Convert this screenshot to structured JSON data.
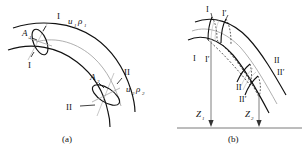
{
  "figure": {
    "type": "technical-line-diagram",
    "background_color": "#ffffff",
    "line_color": "#111111",
    "secondary_line_color": "#999999",
    "panels": [
      {
        "id": "a",
        "caption": "(a)",
        "labels": {
          "section_1_top": "I",
          "section_1_bottom": "I",
          "section_2_top": "II",
          "section_2_bottom": "II",
          "area_1": "A",
          "area_1_sub": "1",
          "area_2": "A",
          "area_2_sub": "2",
          "velocity_1": "u",
          "velocity_1_sub": "1",
          "density_1": "ρ",
          "density_1_sub": "1",
          "velocity_2": "u",
          "velocity_2_sub": "2",
          "density_2": "ρ",
          "density_2_sub": "2"
        }
      },
      {
        "id": "b",
        "caption": "(b)",
        "labels": {
          "section_1_top": "I",
          "section_1p_top": "I′",
          "section_1_bottom": "I",
          "section_1p_bottom": "I′",
          "section_2_top": "II",
          "section_2p_top": "II′",
          "section_2_bottom": "II",
          "section_2p_bottom": "II′",
          "height_1": "Z",
          "height_1_sub": "1",
          "height_2": "Z",
          "height_2_sub": "2"
        }
      }
    ]
  }
}
